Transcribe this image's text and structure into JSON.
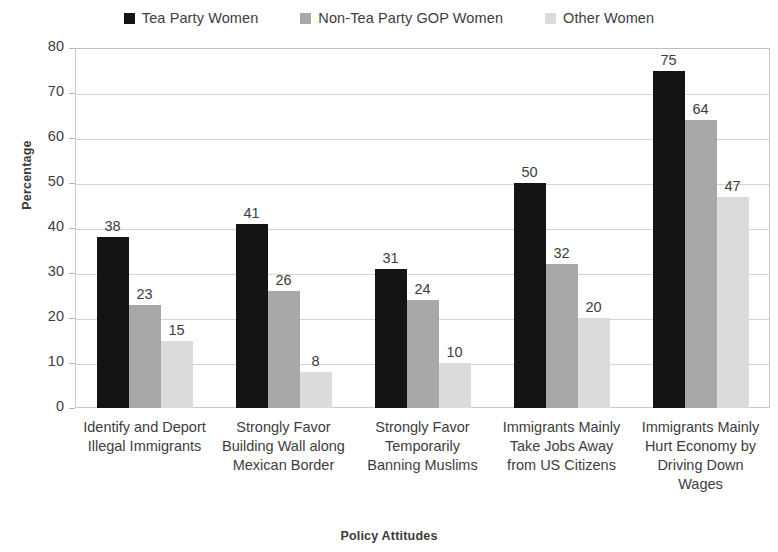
{
  "chart_data": {
    "type": "bar",
    "title": "",
    "xlabel": "Policy Attitudes",
    "ylabel": "Percentage",
    "ylim": [
      0,
      80
    ],
    "ytick_values": [
      80,
      70,
      60,
      50,
      40,
      30,
      20,
      10,
      0
    ],
    "grid": true,
    "legend_position": "top-center",
    "categories": [
      "Identify and Deport Illegal Immigrants",
      "Strongly Favor Building Wall along Mexican Border",
      "Strongly Favor Temporarily Banning Muslims",
      "Immigrants Mainly Take Jobs Away from US Citizens",
      "Immigrants Mainly Hurt Economy by Driving Down Wages"
    ],
    "category_lines": [
      [
        "Identify and Deport",
        "Illegal Immigrants"
      ],
      [
        "Strongly Favor",
        "Building Wall along",
        "Mexican Border"
      ],
      [
        "Strongly Favor",
        "Temporarily",
        "Banning Muslims"
      ],
      [
        "Immigrants Mainly",
        "Take Jobs Away",
        "from US Citizens"
      ],
      [
        "Immigrants Mainly",
        "Hurt Economy by",
        "Driving Down",
        "Wages"
      ]
    ],
    "series": [
      {
        "name": "Tea Party Women",
        "color": "#141414",
        "values": [
          38,
          41,
          31,
          50,
          75
        ],
        "labels": [
          "38",
          "41",
          "31",
          "50",
          "75"
        ]
      },
      {
        "name": "Non-Tea Party GOP Women",
        "color": "#a8a8a8",
        "values": [
          23,
          26,
          24,
          32,
          64
        ],
        "labels": [
          "23",
          "26",
          "24",
          "32",
          "64"
        ]
      },
      {
        "name": "Other Women",
        "color": "#dcdcdc",
        "values": [
          15,
          8,
          10,
          20,
          47
        ],
        "labels": [
          "15",
          "8",
          "10",
          "20",
          "47"
        ]
      }
    ]
  }
}
